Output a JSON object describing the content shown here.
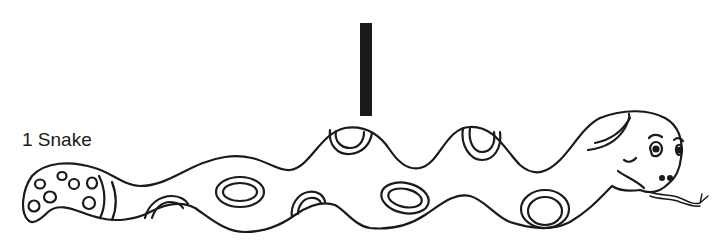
{
  "label": "1 Snake",
  "colors": {
    "ink": "#1a1a1a",
    "background": "#ffffff"
  },
  "figure": {
    "marker": "vertical-bar"
  }
}
